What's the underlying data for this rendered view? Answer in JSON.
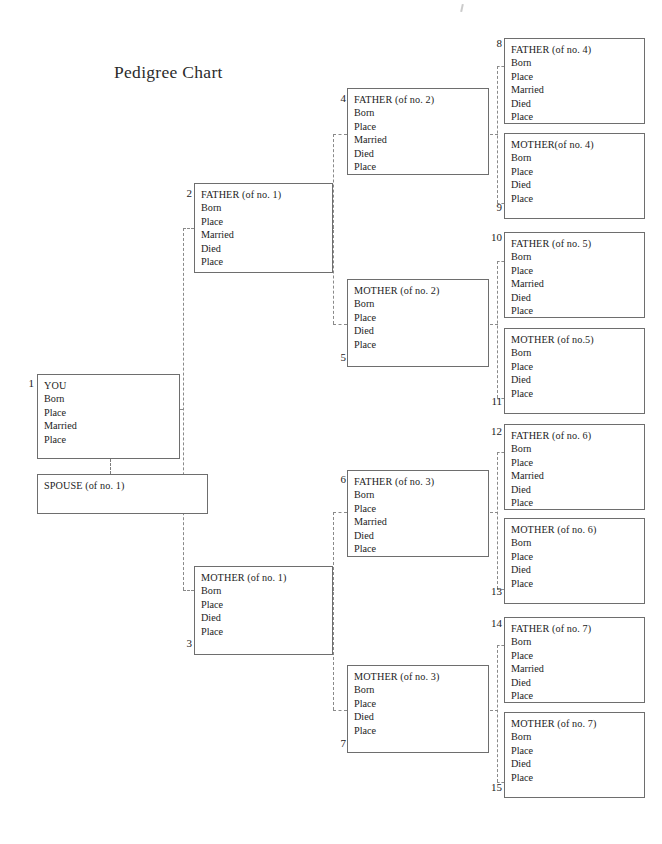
{
  "page": {
    "title": "Pedigree Chart",
    "width": 662,
    "height": 844,
    "background": "#ffffff",
    "border_color": "#6e6e6e",
    "connector_color": "#8a8a8a",
    "text_color": "#1c1c1c"
  },
  "fields": {
    "born": "Born",
    "place": "Place",
    "married": "Married",
    "died": "Died"
  },
  "boxes": [
    {
      "id": "you",
      "number": "1",
      "header": "YOU",
      "lines": [
        "Born",
        "Place",
        "Married",
        "Place"
      ]
    },
    {
      "id": "spouse",
      "number": "",
      "header": "SPOUSE (of no. 1)",
      "lines": []
    },
    {
      "id": "father-1",
      "number": "2",
      "header": "FATHER (of no. 1)",
      "lines": [
        "Born",
        "Place",
        "Married",
        "Died",
        "Place"
      ]
    },
    {
      "id": "mother-1",
      "number": "3",
      "header": "MOTHER (of no. 1)",
      "lines": [
        "Born",
        "Place",
        "Died",
        "Place"
      ]
    },
    {
      "id": "father-2",
      "number": "4",
      "header": "FATHER (of no. 2)",
      "lines": [
        "Born",
        "Place",
        "Married",
        "Died",
        "Place"
      ]
    },
    {
      "id": "mother-2",
      "number": "5",
      "header": "MOTHER (of no. 2)",
      "lines": [
        "Born",
        "Place",
        "Died",
        "Place"
      ]
    },
    {
      "id": "father-3",
      "number": "6",
      "header": "FATHER (of no. 3)",
      "lines": [
        "Born",
        "Place",
        "Married",
        "Died",
        "Place"
      ]
    },
    {
      "id": "mother-3",
      "number": "7",
      "header": "MOTHER (of no. 3)",
      "lines": [
        "Born",
        "Place",
        "Died",
        "Place"
      ]
    },
    {
      "id": "father-4",
      "number": "8",
      "header": "FATHER (of no. 4)",
      "lines": [
        "Born",
        "Place",
        "Married",
        "Died",
        "Place"
      ]
    },
    {
      "id": "mother-4",
      "number": "9",
      "header": "MOTHER(of no. 4)",
      "lines": [
        "Born",
        "Place",
        "Died",
        "Place"
      ]
    },
    {
      "id": "father-5",
      "number": "10",
      "header": "FATHER (of no. 5)",
      "lines": [
        "Born",
        "Place",
        "Married",
        "Died",
        "Place"
      ]
    },
    {
      "id": "mother-5",
      "number": "11",
      "header": "MOTHER (of no.5)",
      "lines": [
        "Born",
        "Place",
        "Died",
        "Place"
      ]
    },
    {
      "id": "father-6",
      "number": "12",
      "header": "FATHER (of no. 6)",
      "lines": [
        "Born",
        "Place",
        "Married",
        "Died",
        "Place"
      ]
    },
    {
      "id": "mother-6",
      "number": "13",
      "header": "MOTHER (of no. 6)",
      "lines": [
        "Born",
        "Place",
        "Died",
        "Place"
      ]
    },
    {
      "id": "father-7",
      "number": "14",
      "header": "FATHER (of no. 7)",
      "lines": [
        "Born",
        "Place",
        "Married",
        "Died",
        "Place"
      ]
    },
    {
      "id": "mother-7",
      "number": "15",
      "header": "MOTHER (of no. 7)",
      "lines": [
        "Born",
        "Place",
        "Died",
        "Place"
      ]
    }
  ]
}
